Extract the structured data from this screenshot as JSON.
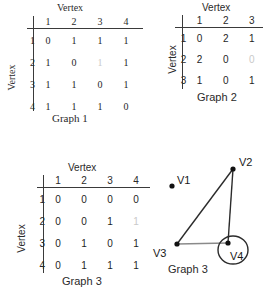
{
  "labels": {
    "vertex_top": "Vertex",
    "vertex_side": "Vertex"
  },
  "graph1": {
    "caption": "Graph 1",
    "top_label": "Vertex",
    "side_label": "Vertex",
    "col_headers": [
      "1",
      "2",
      "3",
      "4"
    ],
    "row_headers": [
      "1",
      "2",
      "3",
      "4"
    ],
    "rows": [
      [
        "0",
        "1",
        "1",
        "1"
      ],
      [
        "1",
        "0",
        "1",
        "1"
      ],
      [
        "1",
        "1",
        "0",
        "1"
      ],
      [
        "1",
        "1",
        "1",
        "0"
      ]
    ],
    "faded_cells": [
      [
        1,
        2
      ]
    ]
  },
  "graph2": {
    "caption": "Graph  2",
    "top_label": "Vertex",
    "side_label": "Vertex",
    "col_headers": [
      "1",
      "2",
      "3"
    ],
    "row_headers": [
      "1",
      "2",
      "3"
    ],
    "rows": [
      [
        "0",
        "2",
        "1"
      ],
      [
        "2",
        "0",
        "0"
      ],
      [
        "1",
        "0",
        "1"
      ]
    ],
    "faded_cells": [
      [
        1,
        2
      ]
    ]
  },
  "graph3_matrix": {
    "caption": "Graph 3",
    "top_label": "Vertex",
    "side_label": "Vertex",
    "col_headers": [
      "1",
      "2",
      "3",
      "4"
    ],
    "row_headers": [
      "1",
      "2",
      "3",
      "4"
    ],
    "rows": [
      [
        "0",
        "0",
        "0",
        "0"
      ],
      [
        "0",
        "0",
        "1",
        "1"
      ],
      [
        "0",
        "1",
        "0",
        "1"
      ],
      [
        "0",
        "1",
        "1",
        "1"
      ]
    ],
    "faded_cells": [
      [
        1,
        3
      ]
    ]
  },
  "graph3_diagram": {
    "caption": "Graph 3",
    "nodes": [
      {
        "id": "V1",
        "label": "V1",
        "x": 22,
        "y": 31,
        "label_dx": 5,
        "label_dy": -12
      },
      {
        "id": "V2",
        "label": "V2",
        "x": 83,
        "y": 14,
        "label_dx": 6,
        "label_dy": -13
      },
      {
        "id": "V3",
        "label": "V3",
        "x": 27,
        "y": 89,
        "label_dx": -24,
        "label_dy": 3
      },
      {
        "id": "V4",
        "label": "V4",
        "x": 78,
        "y": 88,
        "label_dx": 2,
        "label_dy": 7
      }
    ],
    "edges": [
      {
        "from": "V2",
        "to": "V3",
        "color": "#2b2b2b"
      },
      {
        "from": "V2",
        "to": "V4",
        "color": "#2b2b2b"
      },
      {
        "from": "V3",
        "to": "V4",
        "color": "#8a8a8a"
      }
    ],
    "self_loop": {
      "node": "V4",
      "cx": 83,
      "cy": 95,
      "rx": 15,
      "ry": 14,
      "color": "#2b2b2b"
    },
    "node_color": "#111111",
    "node_radius": 2.6
  },
  "colors": {
    "ink": "#1e1e1e",
    "rule": "#3a3a3a",
    "faded": "#c9c9c9",
    "edge_dark": "#2b2b2b",
    "edge_light": "#8a8a8a"
  }
}
